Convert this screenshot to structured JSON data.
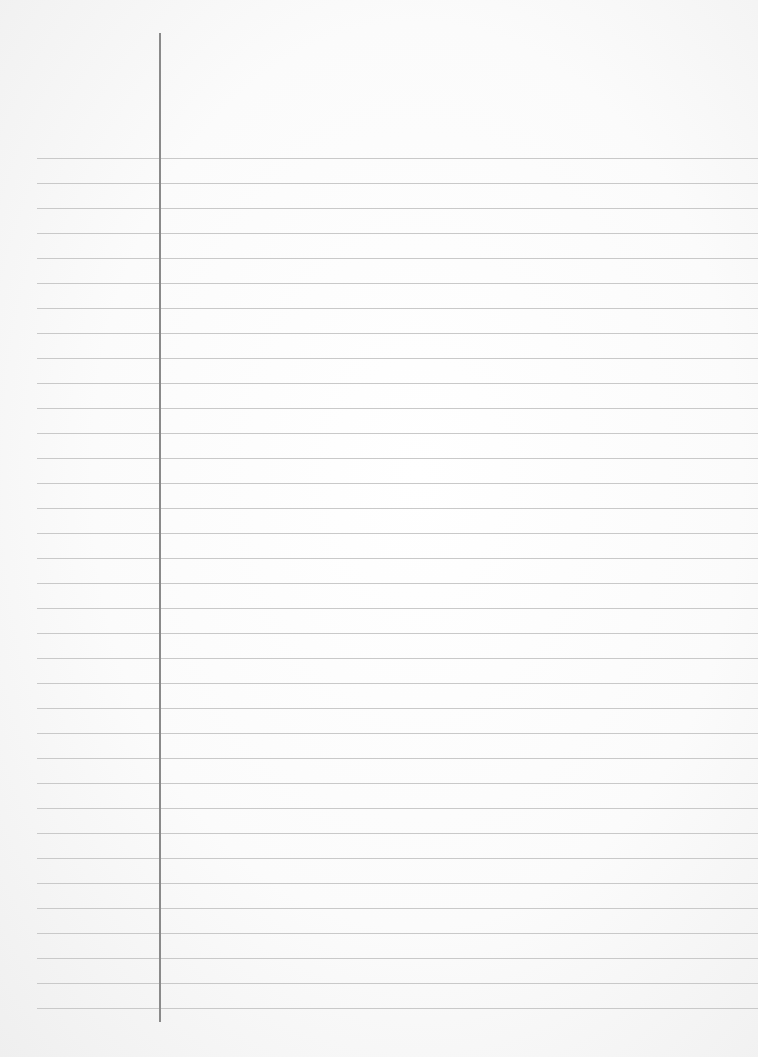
{
  "page": {
    "type": "ruled-notebook-paper",
    "content": "",
    "ruled_lines": {
      "count": 35,
      "first_y": 158,
      "spacing": 25,
      "left_x": 37,
      "color": "#c9c9c9"
    },
    "margin_line": {
      "x": 159,
      "top": 33,
      "bottom": 1022,
      "color": "#8a8a8a"
    },
    "paper_color": "#ffffff"
  }
}
